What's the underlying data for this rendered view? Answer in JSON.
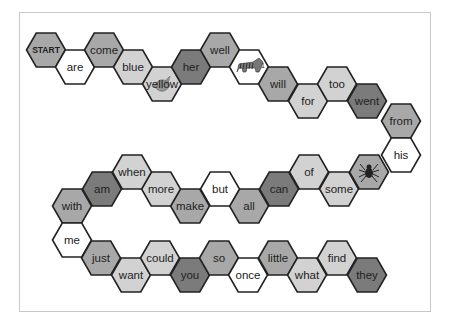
{
  "board": {
    "title": "Sight word hexagon path game",
    "colors": {
      "dark": "#7b7b7b",
      "medium": "#a8a8a8",
      "light": "#d2d2d2",
      "white": "#ffffff",
      "stroke": "#222222"
    },
    "hex_size": {
      "width": 39,
      "height": 34
    },
    "spaces": [
      {
        "label": "START",
        "shade": "medium",
        "x": 46,
        "y": 50,
        "kind": "start"
      },
      {
        "label": "are",
        "shade": "white",
        "x": 75,
        "y": 67
      },
      {
        "label": "come",
        "shade": "medium",
        "x": 104,
        "y": 50
      },
      {
        "label": "blue",
        "shade": "light",
        "x": 133,
        "y": 67
      },
      {
        "label": "yellow",
        "shade": "light",
        "x": 162,
        "y": 84,
        "icon": "bird-icon"
      },
      {
        "label": "her",
        "shade": "dark",
        "x": 191,
        "y": 67
      },
      {
        "label": "well",
        "shade": "medium",
        "x": 220,
        "y": 50
      },
      {
        "label": "",
        "shade": "white",
        "x": 249,
        "y": 67,
        "icon": "tiger-icon"
      },
      {
        "label": "will",
        "shade": "medium",
        "x": 278,
        "y": 84
      },
      {
        "label": "for",
        "shade": "light",
        "x": 308,
        "y": 101
      },
      {
        "label": "too",
        "shade": "light",
        "x": 337,
        "y": 84
      },
      {
        "label": "went",
        "shade": "dark",
        "x": 367,
        "y": 101
      },
      {
        "label": "from",
        "shade": "medium",
        "x": 401,
        "y": 121
      },
      {
        "label": "his",
        "shade": "white",
        "x": 401,
        "y": 155
      },
      {
        "label": "",
        "shade": "medium",
        "x": 369,
        "y": 172,
        "icon": "spider-icon"
      },
      {
        "label": "some",
        "shade": "light",
        "x": 339,
        "y": 189
      },
      {
        "label": "of",
        "shade": "light",
        "x": 309,
        "y": 172
      },
      {
        "label": "can",
        "shade": "dark",
        "x": 279,
        "y": 189
      },
      {
        "label": "all",
        "shade": "medium",
        "x": 249,
        "y": 206
      },
      {
        "label": "but",
        "shade": "white",
        "x": 220,
        "y": 189
      },
      {
        "label": "make",
        "shade": "medium",
        "x": 190,
        "y": 206
      },
      {
        "label": "more",
        "shade": "light",
        "x": 161,
        "y": 189
      },
      {
        "label": "when",
        "shade": "light",
        "x": 132,
        "y": 172
      },
      {
        "label": "am",
        "shade": "dark",
        "x": 102,
        "y": 189
      },
      {
        "label": "with",
        "shade": "medium",
        "x": 72,
        "y": 206
      },
      {
        "label": "me",
        "shade": "white",
        "x": 72,
        "y": 240
      },
      {
        "label": "just",
        "shade": "medium",
        "x": 101,
        "y": 258
      },
      {
        "label": "want",
        "shade": "light",
        "x": 131,
        "y": 275
      },
      {
        "label": "could",
        "shade": "light",
        "x": 160,
        "y": 258
      },
      {
        "label": "you",
        "shade": "dark",
        "x": 190,
        "y": 275
      },
      {
        "label": "so",
        "shade": "medium",
        "x": 219,
        "y": 258
      },
      {
        "label": "once",
        "shade": "white",
        "x": 248,
        "y": 275
      },
      {
        "label": "little",
        "shade": "medium",
        "x": 278,
        "y": 258
      },
      {
        "label": "what",
        "shade": "light",
        "x": 307,
        "y": 275
      },
      {
        "label": "find",
        "shade": "light",
        "x": 337,
        "y": 258
      },
      {
        "label": "they",
        "shade": "dark",
        "x": 367,
        "y": 275
      }
    ]
  }
}
